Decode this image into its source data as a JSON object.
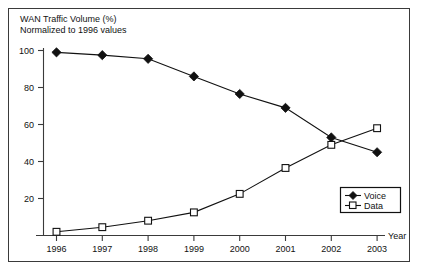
{
  "chart_data": {
    "type": "line",
    "title": "WAN Traffic Volume (%)",
    "subtitle": "Normalized to 1996 values",
    "xlabel": "Year",
    "ylabel": "",
    "categories": [
      "1996",
      "1997",
      "1998",
      "1999",
      "2000",
      "2001",
      "2002",
      "2003"
    ],
    "x": [
      1996,
      1997,
      1998,
      1999,
      2000,
      2001,
      2002,
      2003
    ],
    "series": [
      {
        "name": "Voice",
        "marker": "filled-diamond",
        "values": [
          99,
          97.5,
          95.5,
          86,
          76.5,
          69,
          53,
          45
        ]
      },
      {
        "name": "Data",
        "marker": "open-square",
        "values": [
          2,
          4.5,
          8,
          12.5,
          22.5,
          36.5,
          49,
          58
        ]
      }
    ],
    "ylim": [
      0,
      104
    ],
    "xlim": [
      1995.6,
      2003.6
    ],
    "yticks": [
      20,
      40,
      60,
      80,
      100
    ],
    "ytick_labels": [
      "20",
      "40",
      "60",
      "80",
      "100"
    ],
    "xticks": [
      1996,
      1997,
      1998,
      1999,
      2000,
      2001,
      2002,
      2003
    ],
    "grid": false,
    "legend_position": "lower-right",
    "legend_entries": [
      "Voice",
      "Data"
    ],
    "colors": {
      "line": "#111111",
      "axis": "#3a3a3a",
      "background": "#ffffff",
      "marker_fill_voice": "#111111",
      "marker_fill_data": "#ffffff"
    }
  }
}
